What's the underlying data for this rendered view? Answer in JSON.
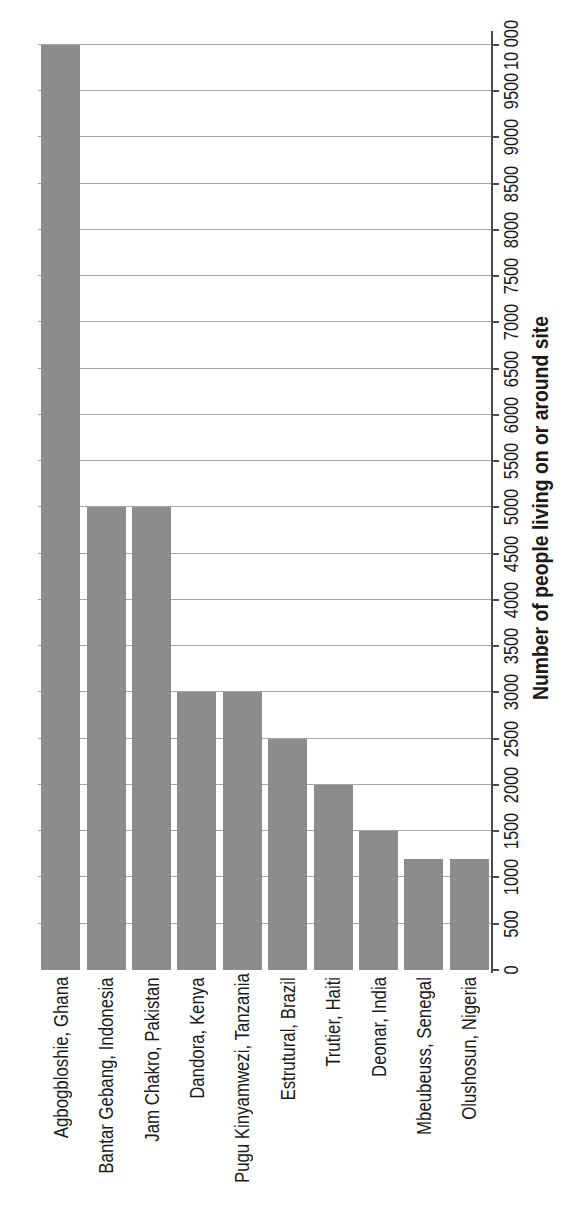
{
  "chart_data": {
    "type": "bar",
    "orientation": "horizontal",
    "page_rotation": "chart rotated 90 degrees counter-clockwise on a portrait page",
    "categories": [
      "Agbogbloshie, Ghana",
      "Bantar Gebang, Indonesia",
      "Jam Chakro, Pakistan",
      "Dandora, Kenya",
      "Pugu Kinyamwezi, Tanzania",
      "Estrutural, Brazil",
      "Trutier, Haiti",
      "Deonar, India",
      "Mbeubeuss, Senegal",
      "Olushosun, Nigeria"
    ],
    "values": [
      10000,
      5000,
      5000,
      3000,
      3000,
      2500,
      2000,
      1500,
      1200,
      1200
    ],
    "value_axis": {
      "label": "Number of people living on or around site",
      "min": 0,
      "max": 10000,
      "tick_interval": 500,
      "tick_labels": [
        "0",
        "500",
        "1000",
        "1500",
        "2000",
        "2500",
        "3000",
        "3500",
        "4000",
        "4500",
        "5000",
        "5500",
        "6000",
        "6500",
        "7000",
        "7500",
        "8000",
        "8500",
        "9000",
        "9500",
        "10 000"
      ]
    },
    "grid": true,
    "legend": "none",
    "colors": {
      "bar": "#8c8c8c",
      "gridline": "#a6a6a6",
      "axis_line": "#4a4a4a",
      "text": "#1a1a1a",
      "background": "#ffffff"
    }
  }
}
